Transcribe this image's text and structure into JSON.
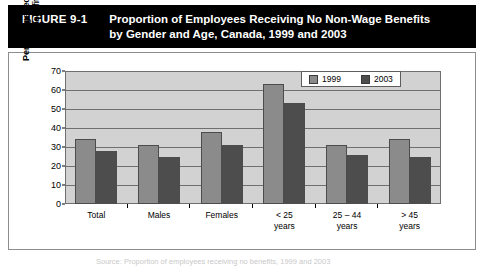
{
  "figure": {
    "label": "FIGURE 9-1",
    "title_line1": "Proportion of Employees Receiving No Non-Wage Benefits",
    "title_line2": "by Gender and Age, Canada, 1999 and 2003",
    "caption": "Source: Proportion of employees receiving no benefits, 1999 and 2003"
  },
  "colors": {
    "banner_bg": "#000000",
    "banner_text": "#ffffff",
    "plot_bg": "#d2d2d2",
    "series_1999": "#8b8b8b",
    "series_2003": "#4d4d4d",
    "frame": "#8d8d8d",
    "gridline": "#6f6f6f"
  },
  "chart_data": {
    "type": "bar",
    "title": "Proportion of Employees Receiving No Non-Wage Benefits by Gender and Age, Canada, 1999 and 2003",
    "xlabel": "",
    "ylabel": "Percentage receiving no benefits",
    "ylim": [
      0,
      70
    ],
    "ytick_step": 10,
    "yticks": [
      0,
      10,
      20,
      30,
      40,
      50,
      60,
      70
    ],
    "grid": true,
    "legend_position": "top-right",
    "categories": [
      "Total",
      "Males",
      "Females",
      "< 25\nyears",
      "25 – 44\nyears",
      "> 45\nyears"
    ],
    "category_labels": [
      {
        "line1": "Total",
        "line2": ""
      },
      {
        "line1": "Males",
        "line2": ""
      },
      {
        "line1": "Females",
        "line2": ""
      },
      {
        "line1": "< 25",
        "line2": "years"
      },
      {
        "line1": "25 – 44",
        "line2": "years"
      },
      {
        "line1": "> 45",
        "line2": "years"
      }
    ],
    "series": [
      {
        "name": "1999",
        "color": "#8b8b8b",
        "values": [
          34,
          31,
          38,
          63,
          31,
          34
        ]
      },
      {
        "name": "2003",
        "color": "#4d4d4d",
        "values": [
          28,
          25,
          31,
          53,
          26,
          25
        ]
      }
    ]
  }
}
